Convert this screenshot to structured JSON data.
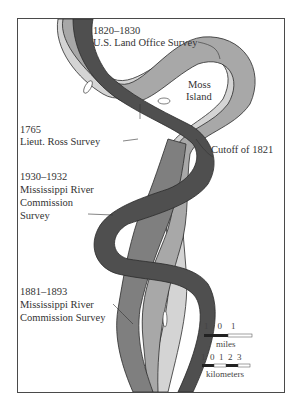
{
  "map": {
    "title": "Mississippi River meander surveys near Moss Island",
    "colors": {
      "survey_1765": "#d4d4d4",
      "survey_1820_1830": "#a8a8a8",
      "survey_1881_1893": "#7f7f7f",
      "survey_1930_1932": "#4f4f4f",
      "outline": "#2b2b2b",
      "frame": "#4a4a4a"
    },
    "labels": {
      "survey_1820": {
        "line1": "1820–1830",
        "line2": "U.S. Land Office Survey"
      },
      "moss_island": {
        "line1": "Moss",
        "line2": "Island"
      },
      "survey_1765": {
        "line1": "1765",
        "line2": "Lieut. Ross Survey"
      },
      "cutoff": {
        "line1": "Cutoff of 1821"
      },
      "survey_1930": {
        "line1": "1930–1932",
        "line2": "Mississippi River",
        "line3": "Commission",
        "line4": "Survey"
      },
      "survey_1881": {
        "line1": "1881–1893",
        "line2": "Mississippi River",
        "line3": "Commission Survey"
      }
    },
    "scale": {
      "miles_ticks": "1    0    1",
      "miles_unit": "miles",
      "km_ticks": "1  0  1  2  3",
      "km_unit": "kilometers"
    }
  }
}
